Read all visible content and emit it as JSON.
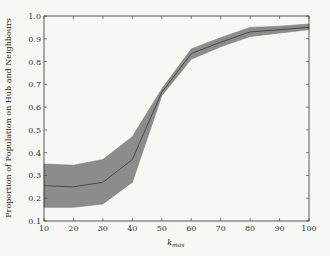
{
  "chart_data": {
    "type": "line",
    "title": "",
    "xlabel": "k_max",
    "xlabel_main": "k",
    "xlabel_sub": "max",
    "ylabel": "Proportion of Population on Hub and Neighbours",
    "xlim": [
      10,
      100
    ],
    "ylim": [
      0.1,
      1.0
    ],
    "grid": false,
    "legend": null,
    "x": [
      10,
      20,
      30,
      40,
      50,
      60,
      70,
      80,
      90,
      100
    ],
    "series": [
      {
        "name": "mean",
        "values": [
          0.255,
          0.25,
          0.27,
          0.37,
          0.665,
          0.835,
          0.885,
          0.93,
          0.94,
          0.95
        ]
      },
      {
        "name": "upper",
        "values": [
          0.35,
          0.345,
          0.37,
          0.47,
          0.68,
          0.855,
          0.905,
          0.95,
          0.955,
          0.965
        ]
      },
      {
        "name": "lower",
        "values": [
          0.16,
          0.16,
          0.175,
          0.27,
          0.65,
          0.81,
          0.865,
          0.91,
          0.925,
          0.94
        ]
      }
    ],
    "xticks": [
      "10",
      "20",
      "30",
      "40",
      "50",
      "60",
      "70",
      "80",
      "90",
      "100"
    ],
    "yticks": [
      "0.1",
      "0.2",
      "0.3",
      "0.4",
      "0.5",
      "0.6",
      "0.7",
      "0.8",
      "0.9",
      "1.0"
    ],
    "colors": {
      "band": "#8c8c8c",
      "line": "#4a4a4a",
      "axis": "#333333"
    }
  }
}
